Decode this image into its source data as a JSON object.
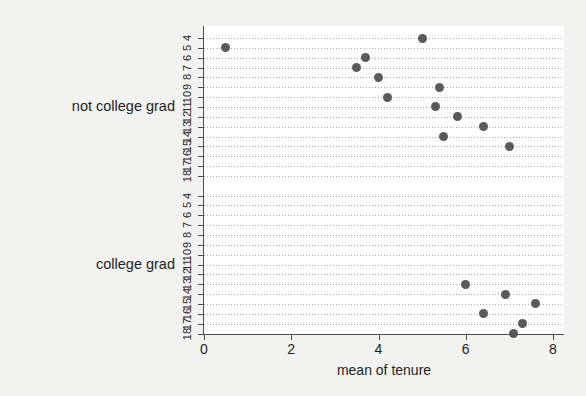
{
  "chart_data": {
    "type": "scatter",
    "title": "",
    "subtitle": "",
    "xlabel": "mean of tenure",
    "ylabel": "",
    "xlim": [
      0,
      8
    ],
    "xticks": [
      0,
      2,
      4,
      6,
      8
    ],
    "xtick_labels": [
      "0",
      "2",
      "4",
      "6",
      "8"
    ],
    "grid": "horizontal-dotted",
    "legend": "none",
    "marker_color": "#5a5a5a",
    "plot_background": "#ffffff",
    "figure_background": "#f2f2f0",
    "axis_color": "#4d4d4d",
    "categories": [
      "4",
      "5",
      "6",
      "7",
      "8",
      "9",
      "10",
      "11",
      "12",
      "13",
      "14",
      "15",
      "16",
      "17",
      "18"
    ],
    "groups": [
      {
        "name": "not college grad",
        "label": "not college grad",
        "points": [
          {
            "category": "4",
            "value": 5.0
          },
          {
            "category": "5",
            "value": 0.5
          },
          {
            "category": "6",
            "value": 3.7
          },
          {
            "category": "7",
            "value": 3.5
          },
          {
            "category": "8",
            "value": 4.0
          },
          {
            "category": "9",
            "value": 5.4
          },
          {
            "category": "10",
            "value": 4.2
          },
          {
            "category": "11",
            "value": 5.3
          },
          {
            "category": "12",
            "value": 5.8
          },
          {
            "category": "13",
            "value": 6.4
          },
          {
            "category": "14",
            "value": 5.5
          },
          {
            "category": "15",
            "value": 7.0
          },
          {
            "category": "16",
            "value": null
          },
          {
            "category": "17",
            "value": null
          },
          {
            "category": "18",
            "value": null
          }
        ]
      },
      {
        "name": "college grad",
        "label": "college grad",
        "points": [
          {
            "category": "4",
            "value": null
          },
          {
            "category": "5",
            "value": null
          },
          {
            "category": "6",
            "value": null
          },
          {
            "category": "7",
            "value": null
          },
          {
            "category": "8",
            "value": null
          },
          {
            "category": "9",
            "value": null
          },
          {
            "category": "10",
            "value": null
          },
          {
            "category": "11",
            "value": null
          },
          {
            "category": "12",
            "value": null
          },
          {
            "category": "13",
            "value": 6.0
          },
          {
            "category": "14",
            "value": 6.9
          },
          {
            "category": "15",
            "value": 7.6
          },
          {
            "category": "16",
            "value": 6.4
          },
          {
            "category": "17",
            "value": 7.3
          },
          {
            "category": "18",
            "value": 7.1
          }
        ]
      }
    ]
  }
}
